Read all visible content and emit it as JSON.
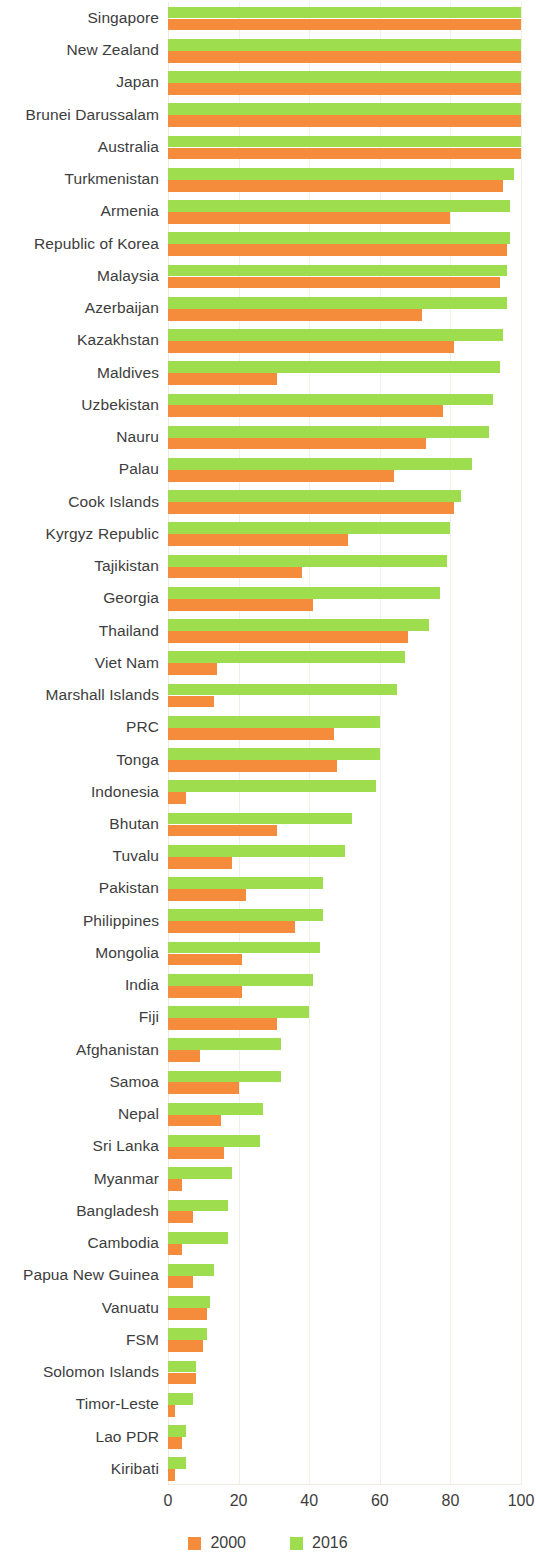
{
  "chart_data": {
    "type": "bar",
    "orientation": "horizontal",
    "title": "",
    "subtitle": "",
    "xlabel": "",
    "ylabel": "",
    "xlim": [
      0,
      100
    ],
    "xticks": [
      0,
      20,
      40,
      60,
      80,
      100
    ],
    "xtick_labels": [
      "0",
      "20",
      "40",
      "60",
      "80",
      "100"
    ],
    "grid": true,
    "grid_axis": "x",
    "legend_position": "bottom-center",
    "colors": {
      "2000": "#f58c3c",
      "2016": "#9ede4e",
      "grid": "#f2efe4",
      "text": "#3d3d3d",
      "background": "#ffffff"
    },
    "legend": [
      {
        "label": "2000",
        "color": "#f58c3c"
      },
      {
        "label": "2016",
        "color": "#9ede4e"
      }
    ],
    "categories": [
      "Singapore",
      "New Zealand",
      "Japan",
      "Brunei Darussalam",
      "Australia",
      "Turkmenistan",
      "Armenia",
      "Republic of Korea",
      "Malaysia",
      "Azerbaijan",
      "Kazakhstan",
      "Maldives",
      "Uzbekistan",
      "Nauru",
      "Palau",
      "Cook Islands",
      "Kyrgyz Republic",
      "Tajikistan",
      "Georgia",
      "Thailand",
      "Viet Nam",
      "Marshall Islands",
      "PRC",
      "Tonga",
      "Indonesia",
      "Bhutan",
      "Tuvalu",
      "Pakistan",
      "Philippines",
      "Mongolia",
      "India",
      "Fiji",
      "Afghanistan",
      "Samoa",
      "Nepal",
      "Sri Lanka",
      "Myanmar",
      "Bangladesh",
      "Cambodia",
      "Papua New Guinea",
      "Vanuatu",
      "FSM",
      "Solomon Islands",
      "Timor-Leste",
      "Lao PDR",
      "Kiribati"
    ],
    "series": [
      {
        "name": "2016",
        "color": "#9ede4e",
        "values": [
          100,
          100,
          100,
          100,
          100,
          98,
          97,
          97,
          96,
          96,
          95,
          94,
          92,
          91,
          86,
          83,
          80,
          79,
          77,
          74,
          67,
          65,
          60,
          60,
          59,
          52,
          50,
          44,
          44,
          43,
          41,
          40,
          32,
          32,
          27,
          26,
          18,
          17,
          17,
          13,
          12,
          11,
          8,
          7,
          5,
          5
        ]
      },
      {
        "name": "2000",
        "color": "#f58c3c",
        "values": [
          100,
          100,
          100,
          100,
          100,
          95,
          80,
          96,
          94,
          72,
          81,
          31,
          78,
          73,
          64,
          81,
          51,
          38,
          41,
          68,
          14,
          13,
          47,
          48,
          5,
          31,
          18,
          22,
          36,
          21,
          21,
          31,
          9,
          20,
          15,
          16,
          4,
          7,
          4,
          7,
          11,
          10,
          8,
          2,
          4,
          2
        ]
      }
    ]
  }
}
